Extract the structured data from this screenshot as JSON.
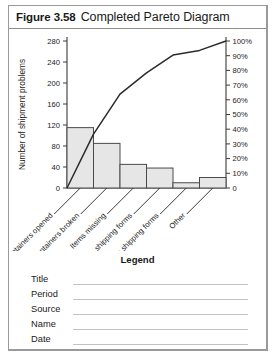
{
  "figure": {
    "number": "Figure 3.58",
    "title": "Completed Pareto Diagram"
  },
  "chart_data": {
    "type": "bar",
    "title": "Completed Pareto Diagram",
    "xlabel": "",
    "ylabel": "Number of shipment problems",
    "y2label": "",
    "ylim": [
      0,
      280
    ],
    "y2lim": [
      0,
      100
    ],
    "yticks": [
      "0",
      "40",
      "80",
      "120",
      "160",
      "200",
      "240",
      "280"
    ],
    "ytickvalues": [
      0,
      40,
      80,
      120,
      160,
      200,
      240,
      280
    ],
    "y2ticks": [
      "0",
      "10%",
      "20%",
      "30%",
      "40%",
      "50%",
      "60%",
      "70%",
      "80%",
      "90%",
      "100%"
    ],
    "y2tickvalues": [
      0,
      10,
      20,
      30,
      40,
      50,
      60,
      70,
      80,
      90,
      100
    ],
    "grid": false,
    "legend": "",
    "categories": [
      "Containers opened",
      "Containers broken",
      "Items missing",
      "No shipping forms",
      "Wrong shipping forms",
      "Other"
    ],
    "values": [
      115,
      85,
      45,
      38,
      10,
      20
    ],
    "cumulative_percent": [
      36.7,
      63.9,
      78.3,
      90.4,
      93.6,
      100
    ],
    "series": [
      {
        "name": "Number of shipment problems",
        "type": "bar",
        "values": [
          115,
          85,
          45,
          38,
          10,
          20
        ]
      },
      {
        "name": "Cumulative percent",
        "type": "line",
        "values": [
          36.7,
          63.9,
          78.3,
          90.4,
          93.6,
          100
        ]
      }
    ],
    "colors": {
      "bar_fill": "#e6e6e6",
      "bar_stroke": "#4a4a4a",
      "line": "#2b2b2b"
    }
  },
  "legend_block": {
    "heading": "Legend",
    "fields": [
      {
        "label": "Title",
        "value": ""
      },
      {
        "label": "Period",
        "value": ""
      },
      {
        "label": "Source",
        "value": ""
      },
      {
        "label": "Name",
        "value": ""
      },
      {
        "label": "Date",
        "value": ""
      }
    ]
  }
}
